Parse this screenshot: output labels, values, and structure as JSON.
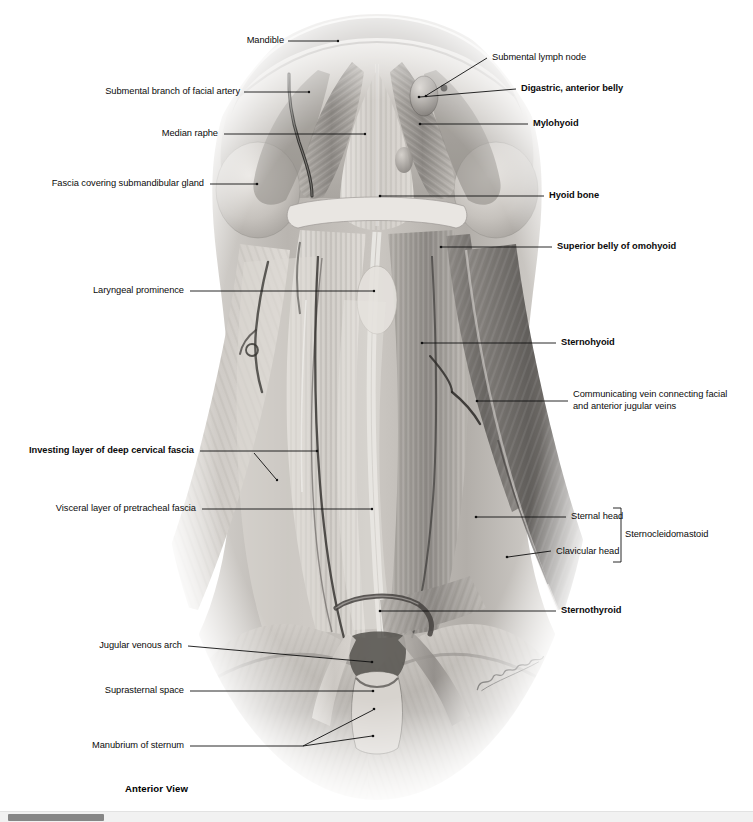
{
  "figure": {
    "caption": "Anterior View",
    "artist_signature": "Jchubb",
    "view": "Anterior View"
  },
  "labels_left": [
    {
      "id": "mandible",
      "text": "Mandible",
      "bold": false
    },
    {
      "id": "submental-branch-facial-artery",
      "text": "Submental branch of facial artery",
      "bold": false
    },
    {
      "id": "median-raphe",
      "text": "Median raphe",
      "bold": false
    },
    {
      "id": "fascia-covering-submandibular-gland",
      "text": "Fascia covering submandibular gland",
      "bold": false
    },
    {
      "id": "laryngeal-prominence",
      "text": "Laryngeal prominence",
      "bold": false
    },
    {
      "id": "investing-layer-deep-cervical-fascia",
      "text": "Investing layer of deep cervical fascia",
      "bold": true
    },
    {
      "id": "visceral-layer-pretracheal-fascia",
      "text": "Visceral layer of pretracheal fascia",
      "bold": false
    },
    {
      "id": "jugular-venous-arch",
      "text": "Jugular venous arch",
      "bold": false
    },
    {
      "id": "suprasternal-space",
      "text": "Suprasternal space",
      "bold": false
    },
    {
      "id": "manubrium-of-sternum",
      "text": "Manubrium of sternum",
      "bold": false
    }
  ],
  "labels_right": [
    {
      "id": "submental-lymph-node",
      "text": "Submental lymph node",
      "bold": false
    },
    {
      "id": "digastric-anterior-belly",
      "text": "Digastric, anterior belly",
      "bold": true
    },
    {
      "id": "mylohyoid",
      "text": "Mylohyoid",
      "bold": true
    },
    {
      "id": "hyoid-bone",
      "text": "Hyoid bone",
      "bold": true
    },
    {
      "id": "superior-belly-of-omohyoid",
      "text": "Superior belly of omohyoid",
      "bold": true
    },
    {
      "id": "sternohyoid",
      "text": "Sternohyoid",
      "bold": true
    },
    {
      "id": "communicating-vein",
      "text": "Communicating vein connecting facial and anterior jugular veins",
      "bold": false
    },
    {
      "id": "sternal-head",
      "text": "Sternal head",
      "bold": false
    },
    {
      "id": "clavicular-head",
      "text": "Clavicular head",
      "bold": false
    },
    {
      "id": "sternocleidomastoid",
      "text": "Sternocleidomastoid",
      "bold": false
    },
    {
      "id": "sternothyroid",
      "text": "Sternothyroid",
      "bold": true
    }
  ],
  "colors": {
    "label_text": "#0b0b0b",
    "leader_line": "#101010",
    "background": "#ffffff",
    "scrollbar_track": "#f1f1f1",
    "scrollbar_thumb": "#868686"
  },
  "scrollbar": {
    "orientation": "horizontal",
    "thumb_position_label": "left"
  }
}
